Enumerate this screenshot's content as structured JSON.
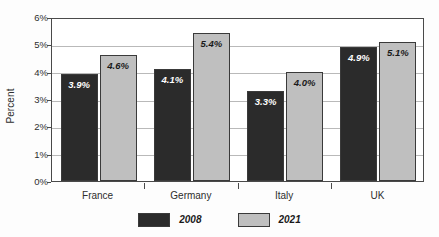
{
  "chart_data": {
    "type": "bar",
    "title": "",
    "xlabel": "",
    "ylabel": "Percent",
    "categories": [
      "France",
      "Germany",
      "Italy",
      "UK"
    ],
    "series": [
      {
        "name": "2008",
        "color": "#2b2b2b",
        "values": [
          3.9,
          4.1,
          3.3,
          4.9
        ],
        "labels": [
          "3.9%",
          "4.1%",
          "3.3%",
          "4.9%"
        ]
      },
      {
        "name": "2021",
        "color": "#bfbfbf",
        "values": [
          4.6,
          5.4,
          4.0,
          5.1
        ],
        "labels": [
          "4.6%",
          "5.4%",
          "4.0%",
          "5.1%"
        ]
      }
    ],
    "ylim": [
      0,
      6
    ],
    "ytick_values": [
      0,
      1,
      2,
      3,
      4,
      5,
      6
    ],
    "ytick_labels": [
      "0%",
      "1%",
      "2%",
      "3%",
      "4%",
      "5%",
      "6%"
    ],
    "grid": "horizontal",
    "legend_position": "bottom-center",
    "value_labels_inside_bars": true
  },
  "axis": {
    "y_title": "Percent"
  },
  "legend": {
    "items": [
      {
        "label": "2008",
        "color": "#2b2b2b"
      },
      {
        "label": "2021",
        "color": "#bfbfbf"
      }
    ]
  }
}
